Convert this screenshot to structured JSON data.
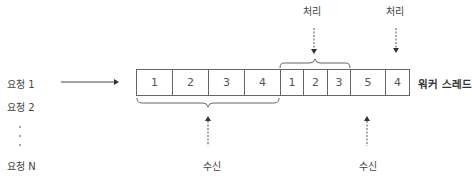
{
  "requests": [
    {
      "label": "요청 1"
    },
    {
      "label": "요청 2"
    },
    {
      "label": "요청 N"
    }
  ],
  "queue": {
    "cells": [
      {
        "value": "1",
        "width": 36
      },
      {
        "value": "2",
        "width": 36
      },
      {
        "value": "3",
        "width": 36
      },
      {
        "value": "4",
        "width": 36
      },
      {
        "value": "1",
        "width": 23
      },
      {
        "value": "2",
        "width": 24
      },
      {
        "value": "3",
        "width": 23
      },
      {
        "value": "5",
        "width": 35
      },
      {
        "value": "4",
        "width": 23
      }
    ],
    "label": "워커 스레드"
  },
  "annotations": {
    "process_1": "처리",
    "process_2": "처리",
    "receive_1": "수신",
    "receive_2": "수신"
  }
}
